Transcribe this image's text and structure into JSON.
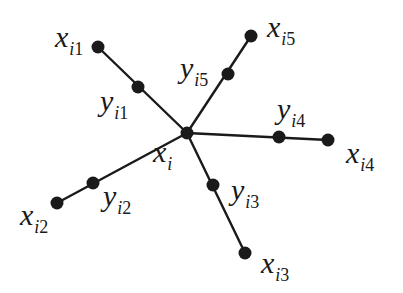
{
  "diagram": {
    "type": "star-graph",
    "center": {
      "id": "xi",
      "main": "x",
      "sub_index": "i",
      "sub_num": "",
      "pos": [
        187,
        133
      ],
      "label_pos": [
        153,
        137
      ]
    },
    "branches": [
      {
        "id": "1",
        "inner": {
          "main": "y",
          "sub_index": "i",
          "sub_num": "1",
          "pos": [
            138,
            87
          ],
          "label_pos": [
            100,
            86
          ]
        },
        "outer": {
          "main": "x",
          "sub_index": "i",
          "sub_num": "1",
          "pos": [
            98,
            47
          ],
          "label_pos": [
            55,
            22
          ]
        }
      },
      {
        "id": "2",
        "inner": {
          "main": "y",
          "sub_index": "i",
          "sub_num": "2",
          "pos": [
            93,
            183
          ],
          "label_pos": [
            103,
            181
          ]
        },
        "outer": {
          "main": "x",
          "sub_index": "i",
          "sub_num": "2",
          "pos": [
            57,
            203
          ],
          "label_pos": [
            20,
            200
          ]
        }
      },
      {
        "id": "3",
        "inner": {
          "main": "y",
          "sub_index": "i",
          "sub_num": "3",
          "pos": [
            213,
            185
          ],
          "label_pos": [
            231,
            175
          ]
        },
        "outer": {
          "main": "x",
          "sub_index": "i",
          "sub_num": "3",
          "pos": [
            245,
            253
          ],
          "label_pos": [
            261,
            248
          ]
        }
      },
      {
        "id": "4",
        "inner": {
          "main": "y",
          "sub_index": "i",
          "sub_num": "4",
          "pos": [
            279,
            137
          ],
          "label_pos": [
            277,
            94
          ]
        },
        "outer": {
          "main": "x",
          "sub_index": "i",
          "sub_num": "4",
          "pos": [
            328,
            140
          ],
          "label_pos": [
            346,
            138
          ]
        }
      },
      {
        "id": "5",
        "inner": {
          "main": "y",
          "sub_index": "i",
          "sub_num": "5",
          "pos": [
            228,
            74
          ],
          "label_pos": [
            180,
            53
          ]
        },
        "outer": {
          "main": "x",
          "sub_index": "i",
          "sub_num": "5",
          "pos": [
            251,
            36
          ],
          "label_pos": [
            267,
            12
          ]
        }
      }
    ],
    "colors": {
      "stroke": "#1a1a1a",
      "node": "#1a1a1a",
      "background": "#ffffff"
    },
    "node_radius": 6.5
  }
}
